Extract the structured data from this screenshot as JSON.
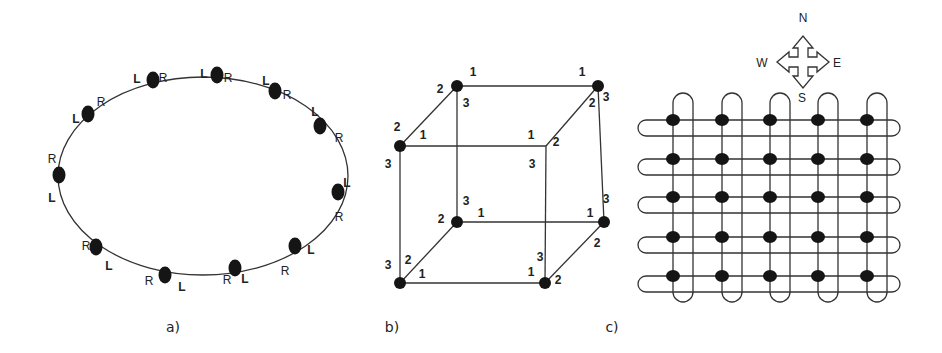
{
  "figure": {
    "panels": [
      {
        "id": "a",
        "caption": "a)",
        "topology": "ring",
        "description": "Bidirectional ring of 12 nodes, each with L and R ports",
        "nodes": [
          {
            "x": 153,
            "y": 80,
            "labels": [
              {
                "t": "L",
                "x": 137,
                "y": 80,
                "b": true
              },
              {
                "t": "R",
                "x": 163,
                "y": 79,
                "b": false
              }
            ]
          },
          {
            "x": 217,
            "y": 75,
            "labels": [
              {
                "t": "L",
                "x": 204,
                "y": 75,
                "b": true
              },
              {
                "t": "R",
                "x": 228,
                "y": 79,
                "b": false
              }
            ]
          },
          {
            "x": 275,
            "y": 91,
            "labels": [
              {
                "t": "L",
                "x": 266,
                "y": 82,
                "b": true
              },
              {
                "t": "R",
                "x": 287,
                "y": 96,
                "b": false
              }
            ]
          },
          {
            "x": 320,
            "y": 126,
            "labels": [
              {
                "t": "L",
                "x": 315,
                "y": 113,
                "b": true
              },
              {
                "t": "R",
                "x": 339,
                "y": 139,
                "b": false
              }
            ]
          },
          {
            "x": 338,
            "y": 192,
            "labels": [
              {
                "t": "L",
                "x": 347,
                "y": 184,
                "b": true
              },
              {
                "t": "R",
                "x": 339,
                "y": 218,
                "b": false
              }
            ]
          },
          {
            "x": 295,
            "y": 246,
            "labels": [
              {
                "t": "L",
                "x": 311,
                "y": 251,
                "b": true
              },
              {
                "t": "R",
                "x": 285,
                "y": 272,
                "b": false
              }
            ]
          },
          {
            "x": 235,
            "y": 268,
            "labels": [
              {
                "t": "L",
                "x": 245,
                "y": 280,
                "b": true
              },
              {
                "t": "R",
                "x": 227,
                "y": 281,
                "b": false
              }
            ]
          },
          {
            "x": 165,
            "y": 275,
            "labels": [
              {
                "t": "L",
                "x": 182,
                "y": 288,
                "b": true
              },
              {
                "t": "R",
                "x": 149,
                "y": 282,
                "b": false
              }
            ]
          },
          {
            "x": 96,
            "y": 247,
            "labels": [
              {
                "t": "L",
                "x": 109,
                "y": 267,
                "b": true
              },
              {
                "t": "R",
                "x": 86,
                "y": 247,
                "b": false
              }
            ]
          },
          {
            "x": 59,
            "y": 175,
            "labels": [
              {
                "t": "L",
                "x": 52,
                "y": 199,
                "b": true
              },
              {
                "t": "R",
                "x": 52,
                "y": 160,
                "b": false
              }
            ]
          },
          {
            "x": 88,
            "y": 114,
            "labels": [
              {
                "t": "L",
                "x": 76,
                "y": 120,
                "b": true
              },
              {
                "t": "R",
                "x": 101,
                "y": 103,
                "b": false
              }
            ]
          }
        ],
        "ring": {
          "cx": 203,
          "cy": 176,
          "rx": 145,
          "ry": 99
        }
      },
      {
        "id": "b",
        "caption": "b)",
        "topology": "cube",
        "description": "3-dimensional hypercube with port numbers 1, 2, 3 at each vertex",
        "vertices": {
          "back_top_left": {
            "x": 457,
            "y": 86,
            "dot": true
          },
          "back_top_right": {
            "x": 598,
            "y": 86,
            "dot": true
          },
          "front_top_left": {
            "x": 400,
            "y": 146,
            "dot": true
          },
          "front_top_right": {
            "x": 546,
            "y": 146,
            "dot": false
          },
          "back_bottom_left": {
            "x": 457,
            "y": 222,
            "dot": true
          },
          "back_bottom_right": {
            "x": 604,
            "y": 222,
            "dot": true
          },
          "front_bottom_left": {
            "x": 400,
            "y": 283,
            "dot": true
          },
          "front_bottom_right": {
            "x": 545,
            "y": 283,
            "dot": true
          }
        },
        "port_labels": [
          {
            "t": "1",
            "x": 473,
            "y": 73
          },
          {
            "t": "2",
            "x": 440,
            "y": 90
          },
          {
            "t": "3",
            "x": 466,
            "y": 104
          },
          {
            "t": "1",
            "x": 582,
            "y": 73
          },
          {
            "t": "2",
            "x": 592,
            "y": 104
          },
          {
            "t": "3",
            "x": 606,
            "y": 98
          },
          {
            "t": "2",
            "x": 397,
            "y": 128
          },
          {
            "t": "1",
            "x": 423,
            "y": 136
          },
          {
            "t": "3",
            "x": 388,
            "y": 165
          },
          {
            "t": "1",
            "x": 531,
            "y": 136
          },
          {
            "t": "2",
            "x": 556,
            "y": 143
          },
          {
            "t": "3",
            "x": 532,
            "y": 165
          },
          {
            "t": "3",
            "x": 466,
            "y": 202
          },
          {
            "t": "1",
            "x": 481,
            "y": 214
          },
          {
            "t": "2",
            "x": 441,
            "y": 220
          },
          {
            "t": "1",
            "x": 590,
            "y": 214
          },
          {
            "t": "3",
            "x": 606,
            "y": 200
          },
          {
            "t": "2",
            "x": 597,
            "y": 244
          },
          {
            "t": "3",
            "x": 388,
            "y": 266
          },
          {
            "t": "2",
            "x": 408,
            "y": 261
          },
          {
            "t": "1",
            "x": 422,
            "y": 275
          },
          {
            "t": "1",
            "x": 531,
            "y": 273
          },
          {
            "t": "3",
            "x": 540,
            "y": 258
          },
          {
            "t": "2",
            "x": 558,
            "y": 281
          }
        ]
      },
      {
        "id": "c",
        "caption": "c)",
        "topology": "torus",
        "description": "5x5 torus network with wrap-around links",
        "rows": 5,
        "cols": 5,
        "node_x": [
          673,
          722,
          770,
          818,
          867
        ],
        "node_y": [
          120,
          159,
          197,
          237,
          276
        ],
        "ring_offset_x": 20,
        "ring_offset_y": 16,
        "compass": {
          "center_x": 803,
          "center_y": 62,
          "directions": {
            "north": "N",
            "south": "S",
            "east": "E",
            "west": "W"
          }
        }
      }
    ]
  }
}
